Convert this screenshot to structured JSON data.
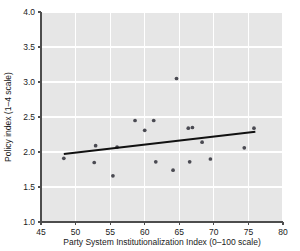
{
  "figure": {
    "background_color": "#ffffff",
    "plot_background_color": "#e6e6e6",
    "grid_color": "#ffffff",
    "point_color": "#4a4a52",
    "line_color": "#111111",
    "axis_color": "#4d4d4d"
  },
  "chart_data": {
    "type": "scatter",
    "title": "",
    "subtitle": "",
    "xlabel": "Party System Institutionalization Index (0–100 scale)",
    "ylabel": "Policy index (1–4 scale)",
    "xlim": [
      45,
      80
    ],
    "ylim": [
      1.0,
      4.0
    ],
    "xticks": [
      45,
      50,
      55,
      60,
      65,
      70,
      75,
      80
    ],
    "yticks": [
      1.0,
      1.5,
      2.0,
      2.5,
      3.0,
      3.5,
      4.0
    ],
    "xtick_labels": [
      "45",
      "50",
      "55",
      "60",
      "65",
      "70",
      "75",
      "80"
    ],
    "ytick_labels": [
      "1.0",
      "1.5",
      "2.0",
      "2.5",
      "3.0",
      "3.5",
      "4.0"
    ],
    "grid": true,
    "grid_axis": "both",
    "legend": false,
    "legend_position": "none",
    "marker": "circle",
    "marker_size": 3,
    "points": [
      {
        "x": 48.3,
        "y": 1.91
      },
      {
        "x": 52.7,
        "y": 1.85
      },
      {
        "x": 52.9,
        "y": 2.09
      },
      {
        "x": 55.4,
        "y": 1.66
      },
      {
        "x": 56.0,
        "y": 2.07
      },
      {
        "x": 58.6,
        "y": 2.45
      },
      {
        "x": 60.0,
        "y": 2.31
      },
      {
        "x": 61.3,
        "y": 2.45
      },
      {
        "x": 61.6,
        "y": 1.86
      },
      {
        "x": 64.1,
        "y": 1.74
      },
      {
        "x": 64.6,
        "y": 3.05
      },
      {
        "x": 66.3,
        "y": 2.34
      },
      {
        "x": 66.9,
        "y": 2.35
      },
      {
        "x": 66.5,
        "y": 1.86
      },
      {
        "x": 68.3,
        "y": 2.14
      },
      {
        "x": 69.5,
        "y": 1.9
      },
      {
        "x": 74.4,
        "y": 2.06
      },
      {
        "x": 75.8,
        "y": 2.34
      }
    ],
    "trend_line": {
      "name": "fitted regression line",
      "x_start": 48.3,
      "y_start": 1.97,
      "x_end": 76.0,
      "y_end": 2.29
    }
  }
}
